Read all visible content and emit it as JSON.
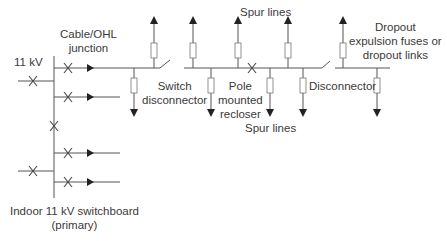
{
  "diagram": {
    "type": "11 kV distribution network single-line diagram",
    "colors": {
      "line": "#555555",
      "text": "#3a3a3a",
      "background": "#ffffff"
    },
    "labels": {
      "voltage": "11 kV",
      "cable_ohl_junction_1": "Cable/OHL",
      "cable_ohl_junction_2": "junction",
      "switch_disconnector_1": "Switch",
      "switch_disconnector_2": "disconnector",
      "spur_lines_top": "Spur lines",
      "pole_recloser_1": "Pole",
      "pole_recloser_2": "mounted",
      "pole_recloser_3": "recloser",
      "spur_lines_bottom": "Spur lines",
      "disconnector": "Disconnector",
      "dropout_1": "Dropout",
      "dropout_2": "expulsion fuses or",
      "dropout_3": "dropout links",
      "switchboard_1": "Indoor 11 kV switchboard",
      "switchboard_2": "(primary)"
    },
    "components": [
      "busbar",
      "incoming supply breaker",
      "bus section breaker",
      "feeder circuit breakers",
      "switch disconnector",
      "pole mounted recloser",
      "disconnector",
      "dropout fuses",
      "spur lines"
    ]
  }
}
